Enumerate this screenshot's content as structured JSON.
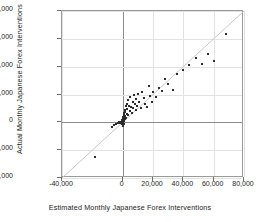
{
  "chart_data": {
    "type": "scatter",
    "title": "",
    "xlabel": "Estimated Monthly Japanese Forex Interventions",
    "ylabel": "Actual Monthly Japanese Forex Interventions",
    "xlim": [
      -40000,
      80000
    ],
    "ylim": [
      -40000,
      80000
    ],
    "xticks": [
      -40000,
      0,
      20000,
      40000,
      60000,
      80000
    ],
    "xticklabels": [
      "-40,000",
      "0",
      "20,000",
      "40,000",
      "60,000",
      "80,000"
    ],
    "yticks": [
      -40000,
      -20000,
      0,
      20000,
      40000,
      60000,
      80000
    ],
    "yticklabels": [
      "-40,000",
      "-20,000",
      "0",
      "20,000",
      "40,000",
      "60,000",
      "80,000"
    ],
    "grid": true,
    "legend": "none",
    "marker_color": "#2b2b2b",
    "reference_line": {
      "type": "identity",
      "slope": 1,
      "intercept": 0,
      "color": "#c8c8c8",
      "x_from": -40000,
      "x_to": 80000
    },
    "points": [
      [
        -18000,
        -25000
      ],
      [
        -7000,
        -3000
      ],
      [
        -5500,
        -2000
      ],
      [
        -4500,
        -1200
      ],
      [
        -3000,
        -600
      ],
      [
        -2500,
        400
      ],
      [
        -2000,
        -800
      ],
      [
        -1500,
        300
      ],
      [
        -1200,
        -400
      ],
      [
        -900,
        200
      ],
      [
        -600,
        900
      ],
      [
        -400,
        -200
      ],
      [
        -300,
        600
      ],
      [
        -200,
        1500
      ],
      [
        -150,
        -1000
      ],
      [
        -100,
        2500
      ],
      [
        0,
        0
      ],
      [
        0,
        900
      ],
      [
        0,
        -1800
      ],
      [
        0,
        3000
      ],
      [
        100,
        -300
      ],
      [
        200,
        1200
      ],
      [
        300,
        4200
      ],
      [
        400,
        -2600
      ],
      [
        500,
        2100
      ],
      [
        600,
        5500
      ],
      [
        700,
        800
      ],
      [
        800,
        3300
      ],
      [
        900,
        -900
      ],
      [
        1000,
        6500
      ],
      [
        1200,
        2400
      ],
      [
        1400,
        9000
      ],
      [
        1600,
        4600
      ],
      [
        1800,
        7800
      ],
      [
        2000,
        11500
      ],
      [
        2200,
        3100
      ],
      [
        2500,
        13000
      ],
      [
        2800,
        6200
      ],
      [
        3000,
        9600
      ],
      [
        3300,
        16000
      ],
      [
        3600,
        5200
      ],
      [
        4000,
        12000
      ],
      [
        4500,
        8300
      ],
      [
        5000,
        18500
      ],
      [
        5500,
        11000
      ],
      [
        6000,
        7000
      ],
      [
        6500,
        14500
      ],
      [
        7000,
        10200
      ],
      [
        7500,
        19500
      ],
      [
        8000,
        13200
      ],
      [
        8500,
        8800
      ],
      [
        9000,
        16800
      ],
      [
        9500,
        12000
      ],
      [
        10000,
        20500
      ],
      [
        11000,
        15000
      ],
      [
        12000,
        10500
      ],
      [
        13000,
        22000
      ],
      [
        14000,
        17500
      ],
      [
        15000,
        13000
      ],
      [
        16000,
        11000
      ],
      [
        17000,
        26000
      ],
      [
        18000,
        19000
      ],
      [
        19000,
        14500
      ],
      [
        20000,
        21500
      ],
      [
        22000,
        18000
      ],
      [
        24000,
        25000
      ],
      [
        26000,
        22500
      ],
      [
        28000,
        31000
      ],
      [
        30000,
        27500
      ],
      [
        33000,
        23000
      ],
      [
        36000,
        35000
      ],
      [
        40000,
        38000
      ],
      [
        44000,
        41500
      ],
      [
        48000,
        46500
      ],
      [
        52000,
        42000
      ],
      [
        56000,
        49000
      ],
      [
        60000,
        44000
      ],
      [
        68000,
        63500
      ]
    ]
  }
}
